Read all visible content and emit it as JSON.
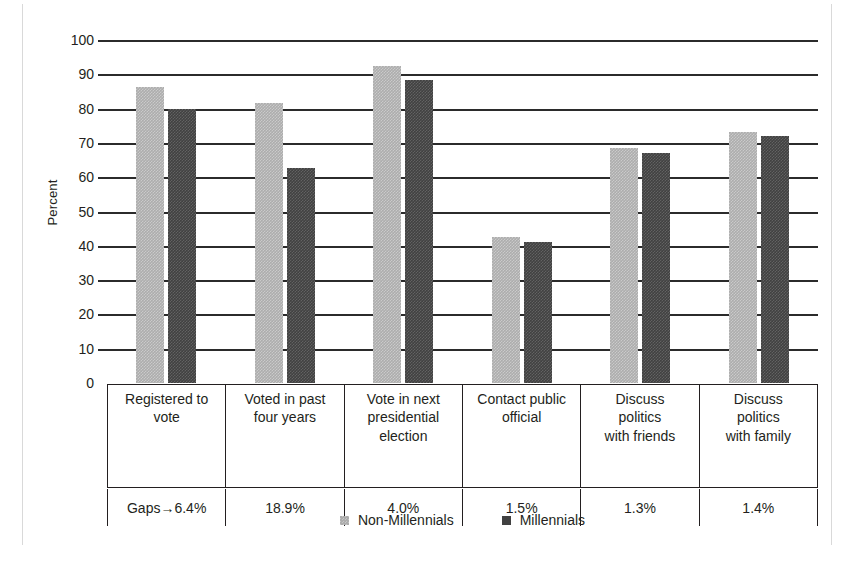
{
  "chart_data": {
    "type": "bar",
    "title": "",
    "xlabel": "",
    "ylabel": "Percent",
    "ylim": [
      0,
      100
    ],
    "ytick_step": 10,
    "yticks": [
      100,
      90,
      80,
      70,
      60,
      50,
      40,
      30,
      20,
      10,
      0
    ],
    "grid": true,
    "legend_position": "bottom",
    "categories": [
      "Registered to\nvote",
      "Voted in past\nfour years",
      "Vote in next\npresidential\nelection",
      "Contact public\nofficial",
      "Discuss\npolitics\nwith friends",
      "Discuss\npolitics\nwith family"
    ],
    "series": [
      {
        "name": "Non-Millennials",
        "color": "#adadad",
        "values": [
          86.4,
          81.5,
          92.4,
          42.5,
          68.5,
          73.3
        ]
      },
      {
        "name": "Millennials",
        "color": "#414141",
        "values": [
          80.0,
          62.6,
          88.4,
          41.0,
          67.2,
          71.9
        ]
      }
    ],
    "gaps_label": "Gaps→",
    "gaps": [
      "6.4%",
      "18.9%",
      "4.0%",
      "1.5%",
      "1.3%",
      "1.4%"
    ]
  },
  "legend": {
    "items": [
      {
        "label": "Non-Millennials"
      },
      {
        "label": "Millennials"
      }
    ]
  }
}
